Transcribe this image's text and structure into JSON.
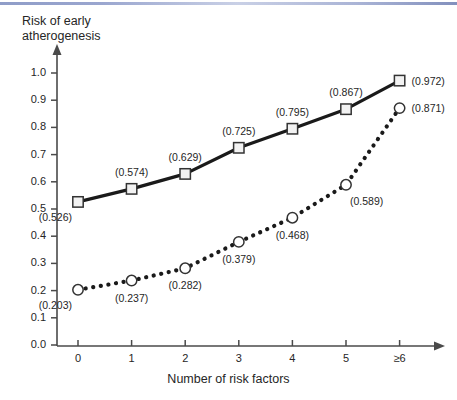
{
  "decor": {
    "top_rule_color": "#8f9dc8"
  },
  "chart_data": {
    "type": "line",
    "title": "",
    "ylabel": "Risk of early\natherogenesis",
    "ylabel_line1": "Risk of early",
    "ylabel_line2": "atherogenesis",
    "xlabel": "Number of risk factors",
    "categories": [
      "0",
      "1",
      "2",
      "3",
      "4",
      "5",
      "≥6"
    ],
    "x": [
      0,
      1,
      2,
      3,
      4,
      5,
      6
    ],
    "ylim": [
      0.0,
      1.0
    ],
    "yticks": [
      "0.0",
      "0.1",
      "0.2",
      "0.3",
      "0.4",
      "0.5",
      "0.6",
      "0.7",
      "0.8",
      "0.9",
      "1.0"
    ],
    "ytick_values": [
      0.0,
      0.1,
      0.2,
      0.3,
      0.4,
      0.5,
      0.6,
      0.7,
      0.8,
      0.9,
      1.0
    ],
    "grid": false,
    "legend": "none",
    "series": [
      {
        "name": "solid-square-series",
        "marker": "square",
        "line_style": "solid",
        "color": "#1a1a1a",
        "marker_fill": "#f2f2f2",
        "values": [
          0.526,
          0.574,
          0.629,
          0.725,
          0.795,
          0.867,
          0.972
        ],
        "labels": [
          "(0.526)",
          "(0.574)",
          "(0.629)",
          "(0.725)",
          "(0.795)",
          "(0.867)",
          "(0.972)"
        ],
        "label_positions": [
          "below-left",
          "above",
          "above",
          "above",
          "above",
          "above",
          "right"
        ]
      },
      {
        "name": "dotted-circle-series",
        "marker": "circle",
        "line_style": "dotted",
        "color": "#1a1a1a",
        "marker_fill": "#ffffff",
        "values": [
          0.203,
          0.237,
          0.282,
          0.379,
          0.468,
          0.589,
          0.871
        ],
        "labels": [
          "(0.203)",
          "(0.237)",
          "(0.282)",
          "(0.379)",
          "(0.468)",
          "(0.589)",
          "(0.871)"
        ],
        "label_positions": [
          "below-left",
          "below",
          "below",
          "below",
          "below",
          "below-right",
          "right"
        ]
      }
    ]
  }
}
